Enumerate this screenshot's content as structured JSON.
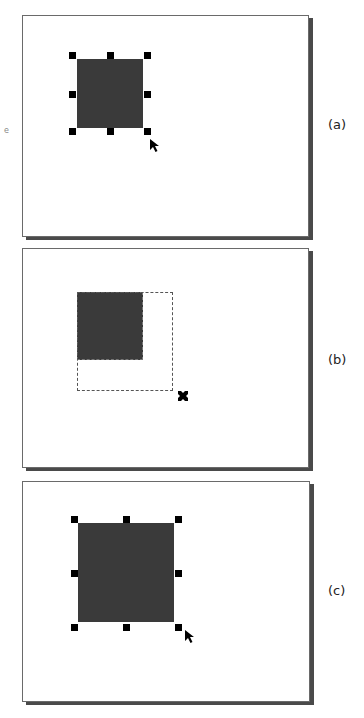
{
  "panels": [
    {
      "id": "a",
      "label": "(a)",
      "state": "shape-selected-with-resize-handles",
      "cursor": "arrow-pointer"
    },
    {
      "id": "b",
      "label": "(b)",
      "state": "dragging-resize-outline",
      "cursor": "move-cross"
    },
    {
      "id": "c",
      "label": "(c)",
      "state": "shape-resized-and-selected",
      "cursor": "arrow-pointer"
    }
  ],
  "colors": {
    "shape_fill": "#3a3a3a",
    "handle": "#000000",
    "frame_border": "#6a6a6a",
    "frame_shadow": "#4a4a4a"
  },
  "artifact_text": "e"
}
